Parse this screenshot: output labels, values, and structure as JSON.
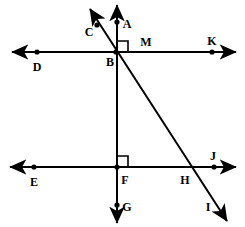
{
  "figure": {
    "kind": "geometry-diagram",
    "width": 245,
    "height": 227,
    "background_color": "#ffffff",
    "stroke_color": "#000000",
    "label_color": "#000000"
  },
  "labels": {
    "A": "A",
    "B": "B",
    "C": "C",
    "D": "D",
    "E": "E",
    "F": "F",
    "G": "G",
    "H": "H",
    "I": "I",
    "J": "J",
    "K": "K",
    "M": "M"
  },
  "label_positions": {
    "A": {
      "x": 127,
      "y": 24
    },
    "B": {
      "x": 110,
      "y": 62
    },
    "C": {
      "x": 89,
      "y": 32
    },
    "D": {
      "x": 37,
      "y": 67
    },
    "E": {
      "x": 34,
      "y": 182
    },
    "F": {
      "x": 125,
      "y": 180
    },
    "G": {
      "x": 127,
      "y": 207
    },
    "H": {
      "x": 185,
      "y": 180
    },
    "I": {
      "x": 208,
      "y": 207
    },
    "J": {
      "x": 213,
      "y": 156
    },
    "K": {
      "x": 212,
      "y": 41
    },
    "M": {
      "x": 146,
      "y": 42
    }
  },
  "points": {
    "A": {
      "x": 117,
      "y": 22,
      "dot": true
    },
    "B": {
      "x": 116,
      "y": 52,
      "dot": true
    },
    "C": {
      "x": 97,
      "y": 25,
      "dot": true
    },
    "D": {
      "x": 37,
      "y": 52,
      "dot": true
    },
    "E": {
      "x": 34,
      "y": 167,
      "dot": true
    },
    "F": {
      "x": 117,
      "y": 167,
      "dot": true
    },
    "G": {
      "x": 117,
      "y": 205,
      "dot": true
    },
    "H": {
      "x": 191,
      "y": 167,
      "dot": false
    },
    "I": {
      "x": 213,
      "y": 207,
      "dot": false
    },
    "J": {
      "x": 214,
      "y": 167,
      "dot": true
    },
    "K": {
      "x": 212,
      "y": 52,
      "dot": true
    },
    "M": {
      "x": 146,
      "y": 42,
      "dot": false
    }
  },
  "lines": [
    {
      "name": "horizontal-line-DK",
      "through": [
        "D",
        "B",
        "M",
        "K"
      ],
      "x1": 12,
      "y1": 52,
      "x2": 236,
      "y2": 52,
      "arrow_start": true,
      "arrow_end": true
    },
    {
      "name": "horizontal-line-EJ",
      "through": [
        "E",
        "F",
        "H",
        "J"
      ],
      "x1": 10,
      "y1": 167,
      "x2": 236,
      "y2": 167,
      "arrow_start": true,
      "arrow_end": true
    },
    {
      "name": "vertical-line-AG",
      "through": [
        "A",
        "B",
        "F",
        "G"
      ],
      "x1": 117,
      "y1": 5,
      "x2": 117,
      "y2": 223,
      "arrow_start": true,
      "arrow_end": true
    },
    {
      "name": "diagonal-line-CI",
      "through": [
        "C",
        "B",
        "H",
        "I"
      ],
      "x1": 90,
      "y1": 9,
      "x2": 227,
      "y2": 221,
      "arrow_start": true,
      "arrow_end": true
    }
  ],
  "right_angle_marks": [
    {
      "name": "right-angle-at-B",
      "vertex": "B",
      "x": 117,
      "y": 52,
      "size": 11,
      "dir_x": 1,
      "dir_y": -1
    },
    {
      "name": "right-angle-at-F",
      "vertex": "F",
      "x": 117,
      "y": 167,
      "size": 11,
      "dir_x": 1,
      "dir_y": -1
    }
  ]
}
